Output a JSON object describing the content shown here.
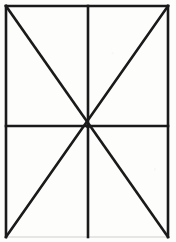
{
  "figure": {
    "background_color": "#fdfdfc",
    "stroke_color": "#1a1a1a",
    "faint_stroke_color": "#cfcfcf",
    "canvas": {
      "width": 176,
      "height": 242
    },
    "rectangle": {
      "name": "outer-rectangle",
      "left": 6,
      "top": 6,
      "right": 168,
      "bottom": 237,
      "width": 162,
      "height": 231,
      "stroke_width": 2.6
    },
    "center_point": {
      "x": 88,
      "y": 126
    },
    "lines": [
      {
        "name": "border-top",
        "x1": 6,
        "y1": 6,
        "x2": 168,
        "y2": 6,
        "stroke_width": 2.6,
        "color": "#1a1a1a"
      },
      {
        "name": "border-left",
        "x1": 6,
        "y1": 6,
        "x2": 6,
        "y2": 237,
        "stroke_width": 2.6,
        "color": "#1a1a1a"
      },
      {
        "name": "border-right",
        "x1": 168,
        "y1": 6,
        "x2": 168,
        "y2": 237,
        "stroke_width": 2.6,
        "color": "#1a1a1a"
      },
      {
        "name": "border-bottom",
        "x1": 6,
        "y1": 237,
        "x2": 168,
        "y2": 237,
        "stroke_width": 1.2,
        "color": "#cfcfcf"
      },
      {
        "name": "vertical-midline",
        "x1": 88,
        "y1": 6,
        "x2": 88,
        "y2": 237,
        "stroke_width": 2.6,
        "color": "#1a1a1a"
      },
      {
        "name": "horizontal-midline",
        "x1": 6,
        "y1": 126,
        "x2": 168,
        "y2": 126,
        "stroke_width": 2.6,
        "color": "#1a1a1a"
      },
      {
        "name": "diagonal-tl-br",
        "x1": 6,
        "y1": 6,
        "x2": 168,
        "y2": 237,
        "stroke_width": 2.6,
        "color": "#1a1a1a"
      },
      {
        "name": "diagonal-tr-bl",
        "x1": 168,
        "y1": 6,
        "x2": 6,
        "y2": 237,
        "stroke_width": 2.6,
        "color": "#1a1a1a"
      }
    ]
  }
}
